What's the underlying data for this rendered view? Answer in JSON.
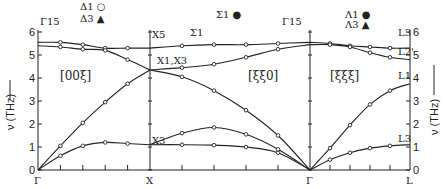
{
  "chart_data": {
    "type": "line",
    "title": "",
    "ylabel": "ν (THz)",
    "ylim": [
      0,
      6
    ],
    "yticks": [
      0,
      1,
      2,
      3,
      4,
      5,
      6
    ],
    "x_points": [
      "Γ",
      "X",
      "Γ",
      "L"
    ],
    "segments": [
      {
        "direction": "[00ξ]",
        "from": "Γ",
        "to": "X",
        "legend": [
          "Δ1 ○",
          "Δ3 ▲"
        ]
      },
      {
        "direction": "[ξξ0]",
        "from": "X",
        "to": "Γ",
        "legend": [
          "Σ1 ●"
        ]
      },
      {
        "direction": "[ξξξ]",
        "from": "Γ",
        "to": "L",
        "legend": [
          "Λ1 ●",
          "Λ3 ▲"
        ]
      }
    ],
    "symmetry_labels": {
      "gamma_left": "Γ15",
      "gamma_mid": "Γ15",
      "x5": "X5",
      "x1x3": "X1,X3",
      "x3": "X3",
      "sigma1": "Σ1",
      "l3_top": "L3",
      "l2": "L2'",
      "l1": "L1",
      "l3_bottom": "L3"
    },
    "series": [
      {
        "name": "Δ TA",
        "segment": 0,
        "q": [
          0,
          0.2,
          0.4,
          0.6,
          0.8,
          1.0
        ],
        "nu": [
          0,
          0.62,
          1.05,
          1.2,
          1.15,
          1.1
        ]
      },
      {
        "name": "Δ LA",
        "segment": 0,
        "q": [
          0,
          0.2,
          0.4,
          0.6,
          0.8,
          1.0
        ],
        "nu": [
          0,
          1.05,
          2.05,
          2.95,
          3.75,
          4.35
        ]
      },
      {
        "name": "Δ TO",
        "segment": 0,
        "q": [
          0,
          0.2,
          0.4,
          0.6,
          0.8,
          1.0
        ],
        "nu": [
          5.55,
          5.55,
          5.45,
          5.3,
          5.3,
          5.3
        ]
      },
      {
        "name": "Δ LO",
        "segment": 0,
        "q": [
          0,
          0.2,
          0.4,
          0.6,
          0.8,
          1.0
        ],
        "nu": [
          5.4,
          5.35,
          5.25,
          5.2,
          4.8,
          4.35
        ]
      },
      {
        "name": "Σ TA1",
        "segment": 1,
        "q": [
          0,
          0.2,
          0.4,
          0.6,
          0.8,
          1.0
        ],
        "nu": [
          1.1,
          1.1,
          1.08,
          1.0,
          0.75,
          0
        ]
      },
      {
        "name": "Σ TA2",
        "segment": 1,
        "q": [
          0,
          0.2,
          0.4,
          0.6,
          0.8,
          1.0
        ],
        "nu": [
          1.1,
          1.6,
          1.85,
          1.55,
          0.9,
          0
        ]
      },
      {
        "name": "Σ LA",
        "segment": 1,
        "q": [
          0,
          0.2,
          0.4,
          0.6,
          0.8,
          1.0
        ],
        "nu": [
          4.35,
          4.05,
          3.45,
          2.6,
          1.5,
          0
        ]
      },
      {
        "name": "Σ O1",
        "segment": 1,
        "q": [
          0,
          0.2,
          0.4,
          0.6,
          0.8,
          1.0
        ],
        "nu": [
          4.35,
          4.45,
          4.6,
          4.9,
          5.25,
          5.45
        ]
      },
      {
        "name": "Σ O2",
        "segment": 1,
        "q": [
          0,
          0.2,
          0.4,
          0.6,
          0.8,
          1.0
        ],
        "nu": [
          5.3,
          5.4,
          5.45,
          5.45,
          5.5,
          5.55
        ]
      },
      {
        "name": "Λ TA",
        "segment": 2,
        "q": [
          0,
          0.2,
          0.4,
          0.6,
          0.8,
          1.0
        ],
        "nu": [
          0,
          0.45,
          0.75,
          0.95,
          1.05,
          1.1
        ]
      },
      {
        "name": "Λ LA",
        "segment": 2,
        "q": [
          0,
          0.2,
          0.4,
          0.6,
          0.8,
          1.0
        ],
        "nu": [
          0,
          0.95,
          1.95,
          2.85,
          3.45,
          3.75
        ]
      },
      {
        "name": "Λ TO",
        "segment": 2,
        "q": [
          0,
          0.2,
          0.4,
          0.6,
          0.8,
          1.0
        ],
        "nu": [
          5.55,
          5.5,
          5.4,
          5.35,
          5.3,
          5.3
        ]
      },
      {
        "name": "Λ LO",
        "segment": 2,
        "q": [
          0,
          0.2,
          0.4,
          0.6,
          0.8,
          1.0
        ],
        "nu": [
          5.45,
          5.45,
          5.35,
          5.1,
          4.9,
          4.8
        ]
      }
    ]
  },
  "layout": {
    "x_px": [
      38,
      150,
      310,
      410
    ],
    "y0_px": 170,
    "px_per_unit": 23
  }
}
